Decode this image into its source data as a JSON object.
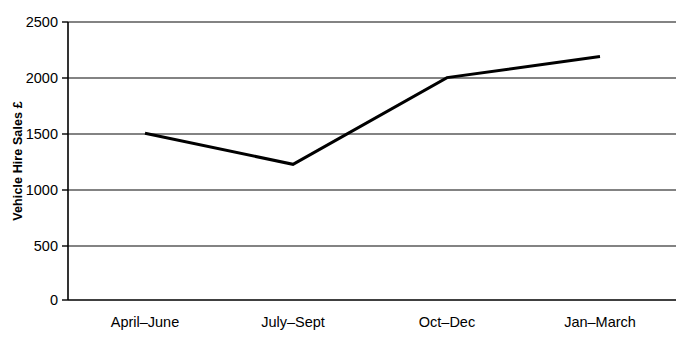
{
  "chart_data": {
    "type": "line",
    "title": "",
    "subtitle": "",
    "xlabel": "",
    "ylabel": "Vehicle Hire Sales £",
    "categories": [
      "April–June",
      "July–Sept",
      "Oct–Dec",
      "Jan–March"
    ],
    "values": [
      1500,
      1220,
      2000,
      2190
    ],
    "series": [
      {
        "name": "Vehicle Hire Sales",
        "values": [
          1500,
          1220,
          2000,
          2190
        ]
      }
    ],
    "ylim": [
      0,
      2500
    ],
    "ytick_labels": [
      "0",
      "500",
      "1000",
      "1500",
      "2000",
      "2500"
    ],
    "ytick_values": [
      0,
      500,
      1000,
      1500,
      2000,
      2500
    ],
    "grid": true,
    "grid_axis": "y",
    "legend": false,
    "legend_position": "none",
    "markers": false,
    "annotations": [],
    "colors": {
      "line": "#000000",
      "grid": "#5a5a5a",
      "axis": "#000000",
      "background": "#ffffff",
      "text": "#000000"
    },
    "line_width": 3
  }
}
